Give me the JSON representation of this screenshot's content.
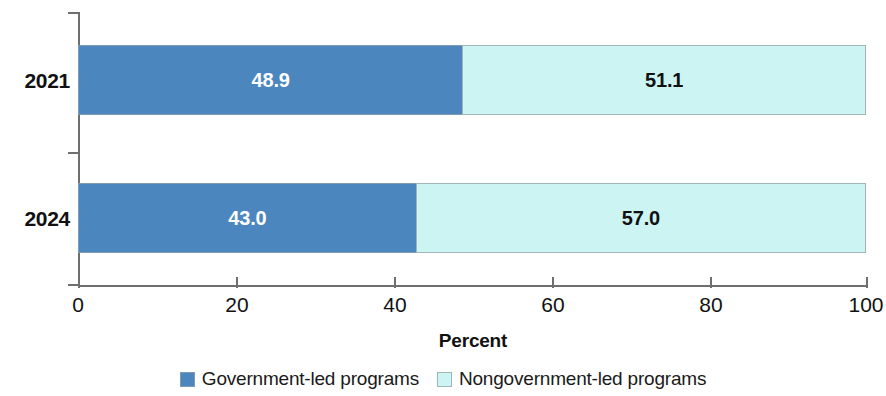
{
  "chart_data": {
    "type": "bar",
    "orientation": "horizontal",
    "stacked": true,
    "percent_stacked": true,
    "title": "",
    "xlabel": "Percent",
    "ylabel": "",
    "xlim": [
      0,
      100
    ],
    "xticks": [
      0,
      20,
      40,
      60,
      80,
      100
    ],
    "xtick_labels": [
      "0",
      "20",
      "40",
      "60",
      "80",
      "100"
    ],
    "categories": [
      "2021",
      "2024"
    ],
    "grid": false,
    "legend_position": "bottom",
    "series": [
      {
        "name": "Government-led programs",
        "color": "#4b86bf",
        "values": [
          48.9,
          43.0
        ],
        "value_labels": [
          "48.9",
          "43.0"
        ],
        "label_color": "#ffffff"
      },
      {
        "name": "Nongovernment-led programs",
        "color": "#ccf4f3",
        "values": [
          51.1,
          57.0
        ],
        "value_labels": [
          "51.1",
          "57.0"
        ],
        "label_color": "#111111"
      }
    ]
  },
  "axis": {
    "x_title": "Percent",
    "ticks": [
      {
        "label": "0",
        "value": 0
      },
      {
        "label": "20",
        "value": 20
      },
      {
        "label": "40",
        "value": 40
      },
      {
        "label": "60",
        "value": 60
      },
      {
        "label": "80",
        "value": 80
      },
      {
        "label": "100",
        "value": 100
      }
    ]
  },
  "rows": [
    {
      "category": "2021",
      "gov_value": "48.9",
      "nongov_value": "51.1"
    },
    {
      "category": "2024",
      "gov_value": "43.0",
      "nongov_value": "57.0"
    }
  ],
  "legend": {
    "items": [
      {
        "label": "Government-led programs",
        "color": "#4b86bf"
      },
      {
        "label": "Nongovernment-led programs",
        "color": "#ccf4f3"
      }
    ]
  }
}
